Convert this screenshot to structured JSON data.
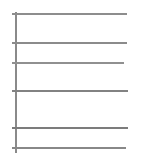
{
  "chart_data": {
    "type": "line",
    "title": "",
    "subtitle": "",
    "xlabel": "",
    "ylabel": "",
    "grid": true,
    "legend": false,
    "legend_position": "none",
    "categories": [],
    "x": [],
    "series": [],
    "xlim": [
      0,
      113
    ],
    "ylim": [
      0,
      139
    ],
    "axis_color": "#8a8a8a",
    "gridline_color": "#8f8f8f",
    "background_color": "#ffffff",
    "y_axis": {
      "name": "y-axis",
      "x_px": 15,
      "top_px": 12,
      "bottom_px": 153,
      "thickness_px": 2
    },
    "gridlines": [
      {
        "index": 0,
        "y_px": 13,
        "x_start_px": 15,
        "x_end_px": 127,
        "thickness_px": 2,
        "color": "#8d8d8d"
      },
      {
        "index": 1,
        "y_px": 42,
        "x_start_px": 15,
        "x_end_px": 127,
        "thickness_px": 2,
        "color": "#8b8b8b"
      },
      {
        "index": 2,
        "y_px": 62,
        "x_start_px": 15,
        "x_end_px": 124,
        "thickness_px": 2,
        "color": "#909090"
      },
      {
        "index": 3,
        "y_px": 90,
        "x_start_px": 15,
        "x_end_px": 128,
        "thickness_px": 2,
        "color": "#828282"
      },
      {
        "index": 4,
        "y_px": 127,
        "x_start_px": 15,
        "x_end_px": 128,
        "thickness_px": 2,
        "color": "#7c7c7c"
      },
      {
        "index": 5,
        "y_px": 147,
        "x_start_px": 15,
        "x_end_px": 126,
        "thickness_px": 2,
        "color": "#888888"
      }
    ],
    "tick_count": 6,
    "tick_labels": [],
    "annotations": []
  }
}
